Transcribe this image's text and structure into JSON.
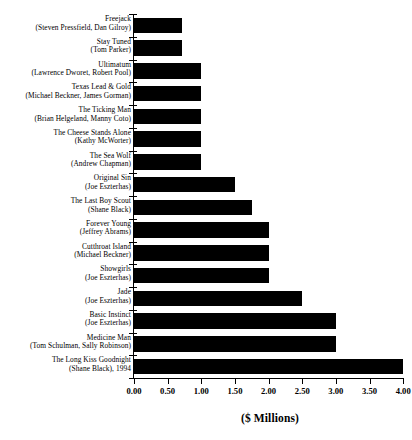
{
  "chart_data": {
    "type": "bar",
    "orientation": "horizontal",
    "title": "",
    "subtitle": "",
    "xlabel": "($ Millions)",
    "ylabel": "",
    "xlim": [
      0.0,
      4.0
    ],
    "grid": false,
    "legend": null,
    "bar_color": "#000000",
    "background_color": "#ffffff",
    "xticks": [
      "0.00",
      "0.50",
      "1.00",
      "1.50",
      "2.00",
      "2.50",
      "3.00",
      "3.50",
      "4.00"
    ],
    "xtick_values": [
      0.0,
      0.5,
      1.0,
      1.5,
      2.0,
      2.5,
      3.0,
      3.5,
      4.0
    ],
    "categories": [
      "Freejack (Steven Pressfield, Dan Gilroy)",
      "Stay Tuned (Tom Parker)",
      "Ultimatum (Lawrence Dworet, Robert Pool)",
      "Texas Lead & Gold (Michael Beckner, James Gorman)",
      "The Ticking Man (Brian Helgeland, Manny Coto)",
      "The Cheese Stands Alone (Kathy McWorter)",
      "The Sea Wolf (Andrew Chapman)",
      "Original Sin (Joe Eszterhas)",
      "The Last Boy Scout (Shane Black)",
      "Forever Young (Jeffrey Abrams)",
      "Cutthroat Island (Michael Beckner)",
      "Showgirls (Joe Eszterhas)",
      "Jade (Joe Eszterhas)",
      "Basic Instinct (Joe Eszterhas)",
      "Medicine Man (Tom Schulman, Sally Robinson)",
      "The Long Kiss Goodnight (Shane Black), 1994"
    ],
    "values": [
      0.72,
      0.72,
      1.0,
      1.0,
      1.0,
      1.0,
      1.0,
      1.5,
      1.75,
      2.0,
      2.0,
      2.0,
      2.5,
      3.0,
      3.0,
      4.0
    ],
    "rows": [
      {
        "title": "Freejack",
        "authors": "(Steven Pressfield, Dan Gilroy)",
        "value": 0.72
      },
      {
        "title": "Stay Tuned",
        "authors": "(Tom Parker)",
        "value": 0.72
      },
      {
        "title": "Ultimatum",
        "authors": "(Lawrence Dworet, Robert Pool)",
        "value": 1.0
      },
      {
        "title": "Texas Lead & Gold",
        "authors": "(Michael Beckner, James Gorman)",
        "value": 1.0
      },
      {
        "title": "The Ticking Man",
        "authors": "(Brian Helgeland, Manny Coto)",
        "value": 1.0
      },
      {
        "title": "The Cheese Stands Alone",
        "authors": "(Kathy McWorter)",
        "value": 1.0
      },
      {
        "title": "The Sea Wolf",
        "authors": "(Andrew Chapman)",
        "value": 1.0
      },
      {
        "title": "Original Sin",
        "authors": "(Joe Eszterhas)",
        "value": 1.5
      },
      {
        "title": "The Last Boy Scout",
        "authors": "(Shane Black)",
        "value": 1.75
      },
      {
        "title": "Forever Young",
        "authors": "(Jeffrey Abrams)",
        "value": 2.0
      },
      {
        "title": "Cutthroat Island",
        "authors": "(Michael Beckner)",
        "value": 2.0
      },
      {
        "title": "Showgirls",
        "authors": "(Joe Eszterhas)",
        "value": 2.0
      },
      {
        "title": "Jade",
        "authors": "(Joe Eszterhas)",
        "value": 2.5
      },
      {
        "title": "Basic Instinct",
        "authors": "(Joe Eszterhas)",
        "value": 3.0
      },
      {
        "title": "Medicine Man",
        "authors": "(Tom Schulman, Sally Robinson)",
        "value": 3.0
      },
      {
        "title": "The Long Kiss Goodnight",
        "authors": "(Shane Black), 1994",
        "value": 4.0
      }
    ]
  }
}
